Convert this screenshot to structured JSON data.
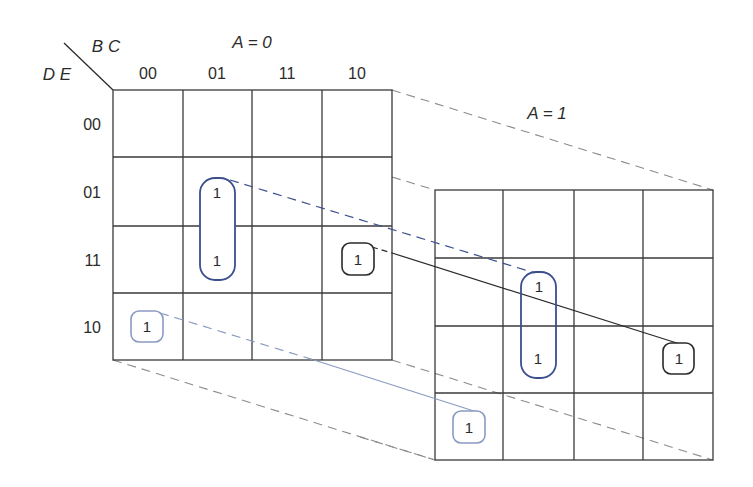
{
  "diagram": {
    "type": "karnaugh-map-5-variable",
    "corner": {
      "col_vars": "B C",
      "row_vars": "D E"
    },
    "col_headers": [
      "00",
      "01",
      "11",
      "10"
    ],
    "row_headers": [
      "00",
      "01",
      "11",
      "10"
    ],
    "maps": [
      {
        "label": "A = 0",
        "cells": [
          [
            "",
            "",
            "",
            ""
          ],
          [
            "",
            "1",
            "",
            ""
          ],
          [
            "",
            "1",
            "",
            "1"
          ],
          [
            "1",
            "",
            "",
            ""
          ]
        ]
      },
      {
        "label": "A = 1",
        "cells": [
          [
            "",
            "",
            "",
            ""
          ],
          [
            "",
            "1",
            "",
            ""
          ],
          [
            "",
            "1",
            "",
            "1"
          ],
          [
            "1",
            "",
            "",
            ""
          ]
        ]
      }
    ],
    "groups": [
      {
        "name": "group-blue-pair",
        "color": "#3b4f8e",
        "cells": "A=0 & A=1, BC=01, DE=01/11",
        "style": "dashed connector"
      },
      {
        "name": "group-black-single",
        "color": "#2a2a2a",
        "cells": "A=0 & A=1, BC=10, DE=11",
        "style": "solid connector"
      },
      {
        "name": "group-lightblue-single",
        "color": "#8a9bc2",
        "cells": "A=0 & A=1, BC=00, DE=10",
        "style": "solid connector"
      }
    ],
    "colors": {
      "grid": "#3a3a3a",
      "projection": "#8c8c8c",
      "blue_loop": "#3b4f8e",
      "black_loop": "#2a2a2a",
      "light_loop": "#8a9bc2"
    }
  }
}
